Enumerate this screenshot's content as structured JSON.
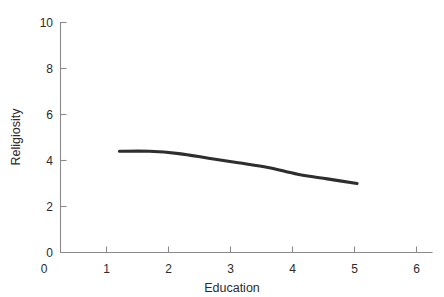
{
  "chart_data": {
    "type": "line",
    "title": "",
    "subtitle": "",
    "xlabel": "Education",
    "ylabel": "Religiosity",
    "xlim": [
      0,
      6
    ],
    "ylim": [
      0,
      10
    ],
    "xticks": [
      0,
      1,
      2,
      3,
      4,
      5,
      6
    ],
    "xtick_labels": [
      "0",
      "1",
      "2",
      "3",
      "4",
      "5",
      "6"
    ],
    "yticks": [
      0,
      2,
      4,
      6,
      8,
      10
    ],
    "ytick_labels": [
      "0",
      "2",
      "4",
      "6",
      "8",
      "10"
    ],
    "grid": false,
    "legend": null,
    "legend_position": "none",
    "annotations": [],
    "series": [
      {
        "name": "Religiosity vs Education",
        "color": "#2e2e2e",
        "line_width": 3,
        "marker": "none",
        "x": [
          1.0,
          1.5,
          2.0,
          2.5,
          3.0,
          3.5,
          4.0,
          4.5,
          5.0
        ],
        "values": [
          4.4,
          4.4,
          4.3,
          4.1,
          3.9,
          3.7,
          3.4,
          3.2,
          3.0
        ]
      }
    ]
  },
  "axes": {
    "y_title": "Religiosity",
    "x_title": "Education",
    "y_tick_0": "0",
    "y_tick_2": "2",
    "y_tick_4": "4",
    "y_tick_6": "6",
    "y_tick_8": "8",
    "y_tick_10": "10",
    "x_tick_0": "0",
    "x_tick_1": "1",
    "x_tick_2": "2",
    "x_tick_3": "3",
    "x_tick_4": "4",
    "x_tick_5": "5",
    "x_tick_6": "6"
  },
  "colors": {
    "curve": "#2e2e2e",
    "axis": "#8a8a8a",
    "text": "#2b2b2b",
    "background": "#ffffff"
  }
}
